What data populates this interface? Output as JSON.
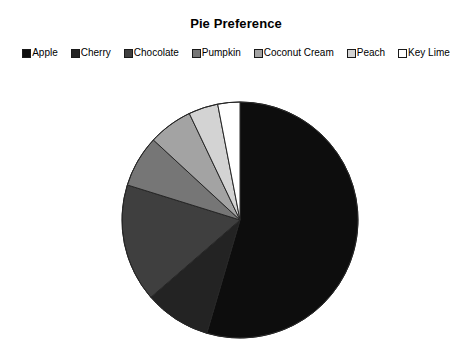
{
  "chart": {
    "title": "Pie Preference"
  },
  "legend": {
    "position": "top",
    "items": [
      {
        "label": "Apple",
        "color": "#0d0d0d",
        "swatch_name": "legend-swatch-apple"
      },
      {
        "label": "Cherry",
        "color": "#232323",
        "swatch_name": "legend-swatch-cherry"
      },
      {
        "label": "Chocolate",
        "color": "#3f3f3f",
        "swatch_name": "legend-swatch-chocolate"
      },
      {
        "label": "Pumpkin",
        "color": "#767676",
        "swatch_name": "legend-swatch-pumpkin"
      },
      {
        "label": "Coconut Cream",
        "color": "#a3a3a3",
        "swatch_name": "legend-swatch-coconut-cream"
      },
      {
        "label": "Peach",
        "color": "#d3d3d3",
        "swatch_name": "legend-swatch-peach"
      },
      {
        "label": "Key Lime",
        "color": "#ffffff",
        "swatch_name": "legend-swatch-key-lime"
      }
    ]
  },
  "chart_data": {
    "type": "pie",
    "title": "Pie Preference",
    "xlabel": "",
    "ylabel": "",
    "grid": false,
    "legend_position": "top",
    "start_angle_deg": 0,
    "direction": "clockwise",
    "center": {
      "x": 240,
      "y": 220
    },
    "radius": 118,
    "labels": [
      "Apple",
      "Cherry",
      "Chocolate",
      "Pumpkin",
      "Coconut Cream",
      "Peach",
      "Key Lime"
    ],
    "values": [
      54,
      9,
      16,
      7,
      6,
      4,
      3
    ],
    "colors": [
      "#0d0d0d",
      "#232323",
      "#3f3f3f",
      "#767676",
      "#a3a3a3",
      "#d3d3d3",
      "#ffffff"
    ],
    "slices": [
      {
        "label": "Apple",
        "value": 54,
        "percent": 54,
        "angle_deg": 194.4,
        "color": "#0d0d0d"
      },
      {
        "label": "Cherry",
        "value": 9,
        "percent": 9,
        "angle_deg": 32.4,
        "color": "#232323"
      },
      {
        "label": "Chocolate",
        "value": 16,
        "percent": 16,
        "angle_deg": 57.6,
        "color": "#3f3f3f"
      },
      {
        "label": "Pumpkin",
        "value": 7,
        "percent": 7,
        "angle_deg": 25.2,
        "color": "#767676"
      },
      {
        "label": "Coconut Cream",
        "value": 6,
        "percent": 6,
        "angle_deg": 21.6,
        "color": "#a3a3a3"
      },
      {
        "label": "Peach",
        "value": 4,
        "percent": 4,
        "angle_deg": 14.4,
        "color": "#d3d3d3"
      },
      {
        "label": "Key Lime",
        "value": 3,
        "percent": 3,
        "angle_deg": 10.8,
        "color": "#ffffff"
      }
    ]
  }
}
